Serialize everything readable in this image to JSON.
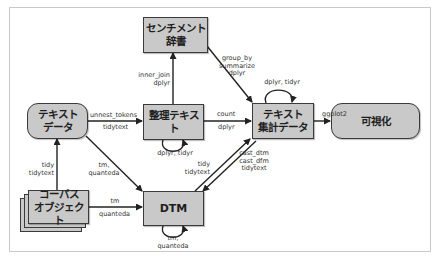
{
  "diagram": {
    "nodes": {
      "sentiment_dict": "センチメント\n辞書",
      "text_data": "テキスト\nデータ",
      "tidy_text": "整理テキスト",
      "summarized_data": "テキスト\n集計データ",
      "visualization": "可視化",
      "corpus_object": "コーパス\nオブジェクト",
      "dtm": "DTM"
    },
    "edges": {
      "text_to_tidy_top": "unnest_tokens",
      "text_to_tidy_bottom": "tidytext",
      "tidy_to_sentiment": "inner_join\ndplyr",
      "sentiment_to_summary": "group_by\nsummarize\ndplyr",
      "tidy_self_loop": "dplyr, tidyr",
      "summary_self_loop": "dplyr, tidyr",
      "tidy_to_summary_top": "count",
      "tidy_to_summary_bottom": "dplyr",
      "summary_to_visual": "ggplot2",
      "corpus_to_text": "tidy\ntidytext",
      "text_to_dtm": "tm,\nquanteda",
      "corpus_to_dtm_top": "tm",
      "corpus_to_dtm_bottom": "quanteda",
      "dtm_to_summary": "tidy\ntidytext",
      "summary_to_dtm": "cast_dtm\ncast_dfm\ntidytext",
      "dtm_self_loop": "tm, quanteda"
    }
  }
}
